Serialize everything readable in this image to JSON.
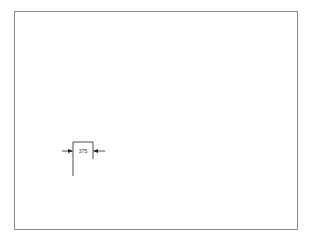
{
  "diagram": {
    "type": "dimension-annotation",
    "frame": {
      "border_color": "#8a8a8a"
    },
    "dimension": {
      "label": "375",
      "style": "inward-arrows",
      "line_color": "#222222"
    }
  }
}
